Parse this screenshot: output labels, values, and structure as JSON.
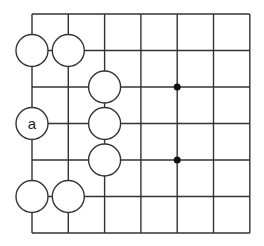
{
  "diagram": {
    "type": "go-board-fragment",
    "grid": {
      "columns": 7,
      "rows": 7,
      "origin_x": 32,
      "origin_y": 14,
      "spacing_x": 36.3,
      "spacing_y": 36.5,
      "line_color": "#333333"
    },
    "star_points": [
      {
        "col": 4,
        "row": 2
      },
      {
        "col": 4,
        "row": 4
      }
    ],
    "stones": [
      {
        "col": 0,
        "row": 1,
        "color": "white",
        "label": ""
      },
      {
        "col": 1,
        "row": 1,
        "color": "white",
        "label": ""
      },
      {
        "col": 2,
        "row": 2,
        "color": "white",
        "label": ""
      },
      {
        "col": 0,
        "row": 3,
        "color": "white",
        "label": "a"
      },
      {
        "col": 2,
        "row": 3,
        "color": "white",
        "label": ""
      },
      {
        "col": 2,
        "row": 4,
        "color": "white",
        "label": ""
      },
      {
        "col": 0,
        "row": 5,
        "color": "white",
        "label": ""
      },
      {
        "col": 1,
        "row": 5,
        "color": "white",
        "label": ""
      }
    ],
    "stone_radius": 16,
    "stone_fill": "#ffffff",
    "stone_stroke": "#333333"
  }
}
